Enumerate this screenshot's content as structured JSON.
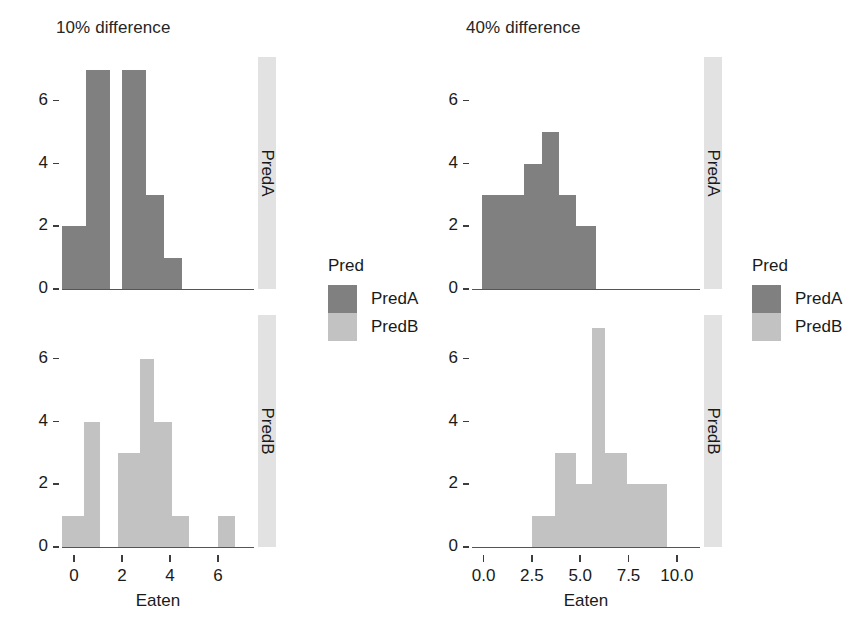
{
  "colors": {
    "predA": "#808080",
    "predB": "#c2c2c2",
    "strip_bg": "#e2e2e2",
    "axis": "#555555",
    "text": "#1a1a1a",
    "background": "#ffffff"
  },
  "legends": [
    {
      "title": "Pred",
      "entries": [
        {
          "label": "PredA",
          "color": "#808080"
        },
        {
          "label": "PredB",
          "color": "#c2c2c2"
        }
      ]
    },
    {
      "title": "Pred",
      "entries": [
        {
          "label": "PredA",
          "color": "#808080"
        },
        {
          "label": "PredB",
          "color": "#c2c2c2"
        }
      ]
    }
  ],
  "chart_data": [
    {
      "type": "bar",
      "title": "10% difference",
      "strip_label": "PredA",
      "series_name": "PredA",
      "color": "#808080",
      "xlabel": "Eaten",
      "ylabel": "",
      "xlim": [
        -0.5,
        7.5
      ],
      "ylim": [
        0,
        7.4
      ],
      "xticks": [
        0,
        2,
        4,
        6
      ],
      "xtick_labels": [
        "0",
        "2",
        "4",
        "6"
      ],
      "yticks": [
        0,
        2,
        4,
        6
      ],
      "ytick_labels": [
        "0",
        "2",
        "4",
        "6"
      ],
      "grid": false,
      "bins": [
        {
          "x0": -0.5,
          "x1": 0.5,
          "value": 2
        },
        {
          "x0": 0.5,
          "x1": 1.5,
          "value": 7
        },
        {
          "x0": 1.5,
          "x1": 2.0,
          "value": 0
        },
        {
          "x0": 2.0,
          "x1": 3.0,
          "value": 7
        },
        {
          "x0": 3.0,
          "x1": 3.75,
          "value": 3
        },
        {
          "x0": 3.75,
          "x1": 4.5,
          "value": 1
        }
      ]
    },
    {
      "type": "bar",
      "title": "10% difference",
      "strip_label": "PredB",
      "series_name": "PredB",
      "color": "#c2c2c2",
      "xlabel": "Eaten",
      "ylabel": "",
      "xlim": [
        -0.5,
        7.5
      ],
      "ylim": [
        0,
        7.4
      ],
      "xticks": [
        0,
        2,
        4,
        6
      ],
      "xtick_labels": [
        "0",
        "2",
        "4",
        "6"
      ],
      "yticks": [
        0,
        2,
        4,
        6
      ],
      "ytick_labels": [
        "0",
        "2",
        "4",
        "6"
      ],
      "grid": false,
      "bins": [
        {
          "x0": -0.5,
          "x1": 0.4,
          "value": 1
        },
        {
          "x0": 0.4,
          "x1": 1.1,
          "value": 4
        },
        {
          "x0": 1.1,
          "x1": 1.85,
          "value": 0
        },
        {
          "x0": 1.85,
          "x1": 2.75,
          "value": 3
        },
        {
          "x0": 2.75,
          "x1": 3.35,
          "value": 6
        },
        {
          "x0": 3.35,
          "x1": 4.1,
          "value": 4
        },
        {
          "x0": 4.1,
          "x1": 4.8,
          "value": 1
        },
        {
          "x0": 4.8,
          "x1": 6.0,
          "value": 0
        },
        {
          "x0": 6.0,
          "x1": 6.7,
          "value": 1
        }
      ]
    },
    {
      "type": "bar",
      "title": "40% difference",
      "strip_label": "PredA",
      "series_name": "PredA",
      "color": "#808080",
      "xlabel": "Eaten",
      "ylabel": "",
      "xlim": [
        -0.6,
        11.2
      ],
      "ylim": [
        0,
        7.4
      ],
      "xticks": [
        0.0,
        2.5,
        5.0,
        7.5,
        10.0
      ],
      "xtick_labels": [
        "0.0",
        "2.5",
        "5.0",
        "7.5",
        "10.0"
      ],
      "yticks": [
        0,
        2,
        4,
        6
      ],
      "ytick_labels": [
        "0",
        "2",
        "4",
        "6"
      ],
      "grid": false,
      "bins": [
        {
          "x0": -0.1,
          "x1": 1.0,
          "value": 3
        },
        {
          "x0": 1.0,
          "x1": 2.1,
          "value": 3
        },
        {
          "x0": 2.1,
          "x1": 3.0,
          "value": 4
        },
        {
          "x0": 3.0,
          "x1": 3.9,
          "value": 5
        },
        {
          "x0": 3.9,
          "x1": 4.8,
          "value": 3
        },
        {
          "x0": 4.8,
          "x1": 5.8,
          "value": 2
        }
      ]
    },
    {
      "type": "bar",
      "title": "40% difference",
      "strip_label": "PredB",
      "series_name": "PredB",
      "color": "#c2c2c2",
      "xlabel": "Eaten",
      "ylabel": "",
      "xlim": [
        -0.6,
        11.2
      ],
      "ylim": [
        0,
        7.4
      ],
      "xticks": [
        0.0,
        2.5,
        5.0,
        7.5,
        10.0
      ],
      "xtick_labels": [
        "0.0",
        "2.5",
        "5.0",
        "7.5",
        "10.0"
      ],
      "yticks": [
        0,
        2,
        4,
        6
      ],
      "ytick_labels": [
        "0",
        "2",
        "4",
        "6"
      ],
      "grid": false,
      "bins": [
        {
          "x0": 2.5,
          "x1": 3.7,
          "value": 1
        },
        {
          "x0": 3.7,
          "x1": 4.8,
          "value": 3
        },
        {
          "x0": 4.8,
          "x1": 5.6,
          "value": 2
        },
        {
          "x0": 5.6,
          "x1": 6.3,
          "value": 7
        },
        {
          "x0": 6.3,
          "x1": 7.4,
          "value": 3
        },
        {
          "x0": 7.4,
          "x1": 8.4,
          "value": 2
        },
        {
          "x0": 8.4,
          "x1": 9.5,
          "value": 2
        }
      ]
    }
  ]
}
